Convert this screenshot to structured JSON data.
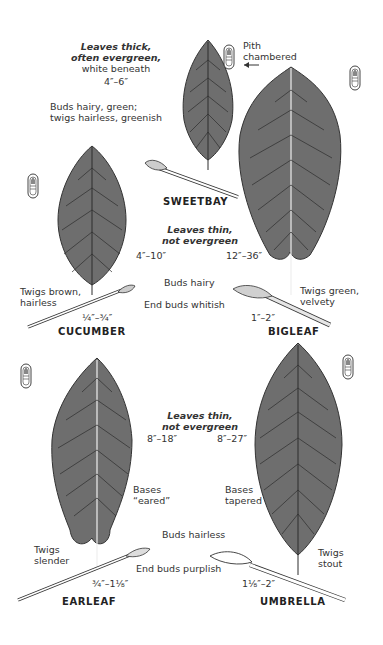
{
  "colors": {
    "leaf_fill": "#6e6e6e",
    "leaf_vein": "#2c2c2c",
    "ink": "#2a2a2a",
    "background": "#ffffff"
  },
  "groups": [
    {
      "id": "evergreen",
      "heading": [
        "Leaves thick,",
        "often evergreen,"
      ],
      "subheading": "white beneath",
      "size": "4″–6″",
      "buds_note": [
        "Buds hairy, green;",
        "twigs hairless, greenish"
      ]
    },
    {
      "id": "thin-hairy",
      "heading": [
        "Leaves thin,",
        "not evergreen"
      ],
      "buds_note": "Buds hairy",
      "end_buds_note": "End buds whitish"
    },
    {
      "id": "thin-hairless",
      "heading": [
        "Leaves thin,",
        "not evergreen"
      ],
      "buds_note": "Buds hairless",
      "end_buds_note": "End buds purplish"
    }
  ],
  "pith_note": {
    "label": [
      "Pith",
      "chambered"
    ],
    "arrow": "←"
  },
  "species": [
    {
      "name": "SWEETBAY",
      "leaf_size": "4″–6″"
    },
    {
      "name": "CUCUMBER",
      "leaf_size": "4″–10″",
      "twig_note": [
        "Twigs brown,",
        "hairless"
      ],
      "bud_size": "¼″–¾″"
    },
    {
      "name": "BIGLEAF",
      "leaf_size": "12″–36″",
      "twig_note": [
        "Twigs green,",
        "velvety"
      ],
      "bud_size": "1″–2″"
    },
    {
      "name": "EARLEAF",
      "leaf_size": "8″–18″",
      "base_note": [
        "Bases",
        "“eared”"
      ],
      "twig_note": [
        "Twigs",
        "slender"
      ],
      "bud_size": "¾″–1⅛″"
    },
    {
      "name": "UMBRELLA",
      "leaf_size": "8″–27″",
      "base_note": [
        "Bases",
        "tapered"
      ],
      "twig_note": [
        "Twigs",
        "stout"
      ],
      "bud_size": "1⅛″–2″"
    }
  ],
  "icons": [
    "pith-cross-section-icon",
    "leaf-illustration",
    "twig-illustration",
    "arrow-left-icon"
  ]
}
